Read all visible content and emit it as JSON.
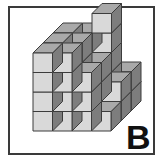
{
  "puzzle": {
    "label": "B",
    "colors": {
      "front": "#d9d9d9",
      "top": "#a9a9a9",
      "side": "#7d7d7d",
      "edge": "#3c3c3c"
    },
    "heightmap_description": "Stacked unit cubes; rows listed front-to-back, columns left-to-right; value = stack height",
    "heightmap": [
      [
        4,
        4,
        3,
        1
      ],
      [
        4,
        4,
        3,
        2
      ],
      [
        4,
        4,
        5,
        2
      ]
    ]
  }
}
